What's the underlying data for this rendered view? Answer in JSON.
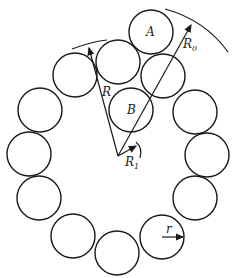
{
  "diagram": {
    "circle_radius": 22,
    "stroke_color": "#1a1a1a",
    "labels": {
      "A": "A",
      "B": "B",
      "R0": "R",
      "R0_sub": "0",
      "R": "R",
      "R1": "R",
      "R1_sub": "1",
      "r": "r"
    }
  }
}
